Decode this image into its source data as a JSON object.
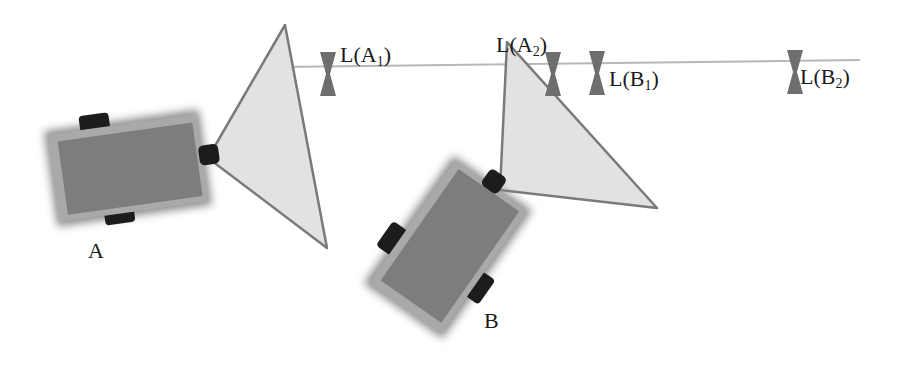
{
  "diagram": {
    "type": "robot-landmark-sensing",
    "colors": {
      "background": "#ffffff",
      "reference_line": "#b8b8b8",
      "sensor_cone_fill": "#e2e2e2",
      "sensor_cone_stroke": "#7a7a7a",
      "robot_body": "#7d7d7d",
      "robot_bevel": "#a9a9a9",
      "wheel": "#1c1c1c",
      "landmark": "#6e6e6e",
      "text": "#1a1a1a"
    },
    "reference_line": {
      "x1": 280,
      "y1": 67,
      "x2": 860,
      "y2": 60
    },
    "robots": [
      {
        "id": "A",
        "label": "A",
        "label_pos": {
          "x": 88,
          "y": 258
        },
        "center": {
          "x": 128,
          "y": 168
        },
        "width": 150,
        "height": 88,
        "angle": -8,
        "sensor_cone": [
          [
            208,
            158
          ],
          [
            285,
            25
          ],
          [
            327,
            248
          ]
        ]
      },
      {
        "id": "B",
        "label": "B",
        "label_pos": {
          "x": 484,
          "y": 328
        },
        "center": {
          "x": 448,
          "y": 247
        },
        "width": 150,
        "height": 88,
        "angle": -55,
        "sensor_cone": [
          [
            500,
            190
          ],
          [
            507,
            42
          ],
          [
            657,
            208
          ]
        ]
      }
    ],
    "landmarks": [
      {
        "id": "LA1",
        "label": "L(A",
        "subscript": "1",
        "close": ")",
        "marker": {
          "x": 328,
          "y": 74
        },
        "text_pos": {
          "x": 340,
          "y": 62
        }
      },
      {
        "id": "LA2",
        "label": "L(A",
        "subscript": "2",
        "close": ")",
        "marker": {
          "x": 553,
          "y": 74
        },
        "text_pos": {
          "x": 496,
          "y": 52
        }
      },
      {
        "id": "LB1",
        "label": "L(B",
        "subscript": "1",
        "close": ")",
        "marker": {
          "x": 597,
          "y": 73
        },
        "text_pos": {
          "x": 609,
          "y": 86
        }
      },
      {
        "id": "LB2",
        "label": "L(B",
        "subscript": "2",
        "close": ")",
        "marker": {
          "x": 795,
          "y": 72
        },
        "text_pos": {
          "x": 800,
          "y": 84
        }
      }
    ]
  }
}
